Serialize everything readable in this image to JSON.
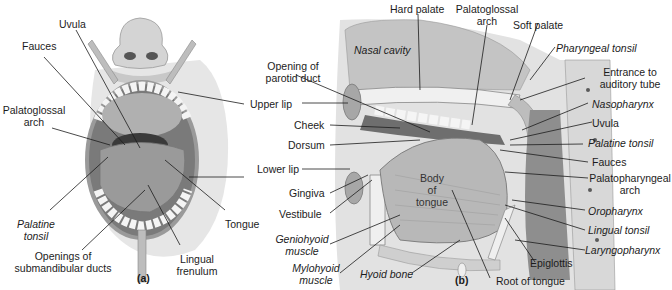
{
  "figure": {
    "panel_a": {
      "tag": "(a)",
      "labels": {
        "uvula": "Uvula",
        "fauces": "Fauces",
        "palatoglossal_1": "Palatoglossal",
        "palatoglossal_2": "arch",
        "palatine_1": "Palatine",
        "palatine_2": "tonsil",
        "openings_1": "Openings of",
        "openings_2": "submandibular ducts",
        "lingual_1": "Lingual",
        "lingual_2": "frenulum",
        "tongue": "Tongue"
      }
    },
    "middle": {
      "upper_lip": "Upper lip",
      "lower_lip": "Lower lip"
    },
    "panel_b": {
      "tag": "(b)",
      "labels": {
        "hard_palate": "Hard palate",
        "palatoglossal_1": "Palatoglossal",
        "palatoglossal_2": "arch",
        "soft_palate": "Soft palate",
        "nasal_cavity": "Nasal cavity",
        "parotid_1": "Opening of",
        "parotid_2": "parotid duct",
        "cheek": "Cheek",
        "dorsum": "Dorsum",
        "gingiva": "Gingiva",
        "vestibule": "Vestibule",
        "geniohyoid_1": "Geniohyoid",
        "geniohyoid_2": "muscle",
        "mylohyoid_1": "Mylohyoid",
        "mylohyoid_2": "muscle",
        "hyoid_bone": "Hyoid bone",
        "body_1": "Body",
        "body_2": "of",
        "body_3": "tongue",
        "pharyngeal_tonsil": "Pharyngeal tonsil",
        "entrance_1": "Entrance to",
        "entrance_2": "auditory tube",
        "nasopharynx": "Nasopharynx",
        "uvula": "Uvula",
        "palatine_tonsil": "Palatine tonsil",
        "fauces": "Fauces",
        "palatopharyngeal_1": "Palatopharyngeal",
        "palatopharyngeal_2": "arch",
        "oropharynx": "Oropharynx",
        "lingual_tonsil": "Lingual tonsil",
        "laryngopharynx": "Laryngopharynx",
        "epiglottis": "Epiglottis",
        "root_of_tongue": "Root of tongue"
      }
    }
  }
}
